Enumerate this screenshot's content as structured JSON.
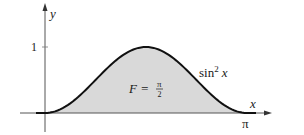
{
  "chart_data": {
    "type": "area",
    "title": "",
    "function": "sin^2 x",
    "curve_label": "sin² x",
    "area_label": {
      "text_left": "F =",
      "numerator": "π",
      "denominator": "2"
    },
    "xlabel": "x",
    "ylabel": "y",
    "x_ticks": [
      {
        "value": 3.14159,
        "label": "π"
      }
    ],
    "y_ticks": [
      {
        "value": 1,
        "label": "1"
      }
    ],
    "xlim": [
      -0.75,
      3.6
    ],
    "ylim": [
      -0.25,
      1.6
    ],
    "x": [
      0,
      0.3927,
      0.7854,
      1.1781,
      1.5708,
      1.9635,
      2.3562,
      2.7489,
      3.1416
    ],
    "values": [
      0,
      0.1464,
      0.5,
      0.8536,
      1,
      0.8536,
      0.5,
      0.1464,
      0
    ],
    "shaded_region": {
      "from": 0,
      "to": 3.1416,
      "area": 1.5708
    },
    "grid": false,
    "legend": null,
    "colors": {
      "curve": "#111111",
      "fill": "#d9d9d9",
      "axes": "#555555"
    }
  }
}
